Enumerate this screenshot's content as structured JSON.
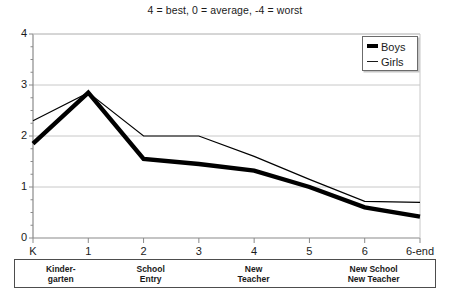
{
  "chart_data": {
    "type": "line",
    "title": "4 = best, 0 = average, -4 = worst",
    "xlabel": "",
    "ylabel": "",
    "ylim": [
      0,
      4
    ],
    "yticks": [
      0,
      1,
      2,
      3,
      4
    ],
    "grid": true,
    "legend_position": "top-right",
    "categories": [
      "K",
      "1",
      "2",
      "3",
      "4",
      "5",
      "6",
      "6-end"
    ],
    "series": [
      {
        "name": "Boys",
        "style": "thick-black",
        "values": [
          1.85,
          2.85,
          1.55,
          1.45,
          1.32,
          1.0,
          0.6,
          0.42
        ]
      },
      {
        "name": "Girls",
        "style": "thin-black",
        "values": [
          2.3,
          2.85,
          2.0,
          2.0,
          1.6,
          1.15,
          0.72,
          0.7
        ]
      }
    ],
    "annotations": [
      {
        "label_lines": [
          "Kinder-",
          "garten"
        ],
        "start": "K",
        "end": "K"
      },
      {
        "label_lines": [
          "School",
          "Entry"
        ],
        "start": "1",
        "end": "1"
      },
      {
        "label_lines": [
          "New",
          "Teacher"
        ],
        "start": "3",
        "end": "3"
      },
      {
        "label_lines": [
          "New School",
          "New Teacher"
        ],
        "start": "5",
        "end": "5"
      }
    ]
  },
  "axis": {
    "y_tick_labels": [
      "4",
      "3",
      "2",
      "1",
      "0"
    ],
    "x_tick_labels": [
      "K",
      "1",
      "2",
      "3",
      "4",
      "5",
      "6",
      "6-end"
    ]
  },
  "legend": {
    "items": [
      {
        "label": "Boys",
        "swatch": "thick-line-swatch"
      },
      {
        "label": "Girls",
        "swatch": "thin-line-swatch"
      }
    ]
  },
  "phase_table": {
    "cells": [
      {
        "line1": "Kinder-",
        "line2": "garten"
      },
      {
        "line1": "School",
        "line2": "Entry"
      },
      {
        "line1": "New",
        "line2": "Teacher"
      },
      {
        "line1": "New School",
        "line2": "New Teacher"
      }
    ]
  },
  "colors": {
    "ink": "#1a1a1a",
    "series_line": "#000000",
    "grid": "#c8c8c8",
    "axis": "#8a8a8a",
    "background": "#ffffff"
  }
}
